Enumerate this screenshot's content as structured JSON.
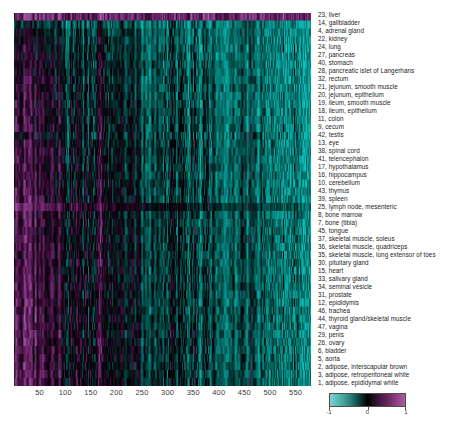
{
  "chart_data": {
    "type": "heatmap",
    "title": "",
    "xlabel": "",
    "ylabel": "",
    "xlim": [
      0,
      580
    ],
    "ylim": [
      0,
      47
    ],
    "grid": false,
    "x_ticks": [
      50,
      100,
      150,
      200,
      250,
      300,
      350,
      400,
      450,
      500,
      550
    ],
    "colorbar": {
      "ticks": [
        -1,
        0,
        1
      ],
      "tick_labels": [
        "-1",
        "0",
        "1"
      ],
      "vmin": -1,
      "vmax": 1,
      "low_color": "#7fd3c8",
      "mid_color": "#000000",
      "high_color": "#a85fa0",
      "position": "bottom-right"
    },
    "row_labels": [
      "23, liver",
      "14, gallbladder",
      "4, adrenal gland",
      "22, kidney",
      "24, lung",
      "27, pancreas",
      "40, stomach",
      "28, pancreatic islet of Langerhans",
      "32, rectum",
      "21, jejunum, smooth muscle",
      "20, jejunum, epithelium",
      "19, ileum, smooth muscle",
      "18, ileum, epithelium",
      "11, colon",
      "9, cecum",
      "42, testis",
      "13, eye",
      "38, spinal cord",
      "41, telencephalon",
      "17, hypothalamus",
      "16, hippocampus",
      "10, cerebellum",
      "43, thymus",
      "39, spleen",
      "25, lymph node, mesenteric",
      "8, bone marrow",
      "7, bone (tibia)",
      "45, tongue",
      "37, skeletal muscle, soleus",
      "36, skeletal muscle, quadriceps",
      "35, skeletal muscle, long extensor of toes",
      "30, pituitary gland",
      "15, heart",
      "33, salivary gland",
      "34, seminal vesicle",
      "31, prostate",
      "12, epididymis",
      "46, trachea",
      "44, thyroid gland/skeletal muscle",
      "47, vagina",
      "29, penis",
      "26, ovary",
      "6, bladder",
      "5, aorta",
      "2, adipose, interscapular brown",
      "3, adipose, retroperitoneal white",
      "1, adipose, epididymal white"
    ],
    "n_rows": 47,
    "n_columns": 580,
    "row_profiles": [
      {
        "row": 0,
        "base": 0.62,
        "grad": -0.05,
        "noise": 0.22,
        "streak": 0.55
      },
      {
        "row": 1,
        "base": -0.18,
        "grad": -0.55,
        "noise": 0.3,
        "streak": 0.7
      },
      {
        "row": 2,
        "base": 0.02,
        "grad": -0.75,
        "noise": 0.28,
        "streak": 0.65
      },
      {
        "row": 3,
        "base": 0.1,
        "grad": -0.85,
        "noise": 0.3,
        "streak": 0.68
      },
      {
        "row": 4,
        "base": 0.16,
        "grad": -0.92,
        "noise": 0.3,
        "streak": 0.66
      },
      {
        "row": 5,
        "base": 0.18,
        "grad": -0.95,
        "noise": 0.3,
        "streak": 0.64
      },
      {
        "row": 6,
        "base": 0.22,
        "grad": -0.98,
        "noise": 0.3,
        "streak": 0.66
      },
      {
        "row": 7,
        "base": 0.24,
        "grad": -1.0,
        "noise": 0.3,
        "streak": 0.66
      },
      {
        "row": 8,
        "base": 0.26,
        "grad": -1.02,
        "noise": 0.3,
        "streak": 0.66
      },
      {
        "row": 9,
        "base": 0.3,
        "grad": -1.05,
        "noise": 0.3,
        "streak": 0.68
      },
      {
        "row": 10,
        "base": 0.3,
        "grad": -1.05,
        "noise": 0.3,
        "streak": 0.68
      },
      {
        "row": 11,
        "base": 0.32,
        "grad": -1.06,
        "noise": 0.3,
        "streak": 0.68
      },
      {
        "row": 12,
        "base": 0.32,
        "grad": -1.06,
        "noise": 0.3,
        "streak": 0.68
      },
      {
        "row": 13,
        "base": 0.34,
        "grad": -1.08,
        "noise": 0.3,
        "streak": 0.68
      },
      {
        "row": 14,
        "base": 0.34,
        "grad": -1.08,
        "noise": 0.3,
        "streak": 0.68
      },
      {
        "row": 15,
        "base": 0.2,
        "grad": -0.9,
        "noise": 0.34,
        "streak": 0.72
      },
      {
        "row": 16,
        "base": 0.34,
        "grad": -1.06,
        "noise": 0.3,
        "streak": 0.66
      },
      {
        "row": 17,
        "base": 0.36,
        "grad": -1.08,
        "noise": 0.3,
        "streak": 0.66
      },
      {
        "row": 18,
        "base": 0.36,
        "grad": -1.08,
        "noise": 0.3,
        "streak": 0.66
      },
      {
        "row": 19,
        "base": 0.36,
        "grad": -1.08,
        "noise": 0.3,
        "streak": 0.66
      },
      {
        "row": 20,
        "base": 0.36,
        "grad": -1.08,
        "noise": 0.3,
        "streak": 0.66
      },
      {
        "row": 21,
        "base": 0.38,
        "grad": -1.1,
        "noise": 0.3,
        "streak": 0.66
      },
      {
        "row": 22,
        "base": 0.4,
        "grad": -1.1,
        "noise": 0.3,
        "streak": 0.66
      },
      {
        "row": 23,
        "base": 0.4,
        "grad": -1.1,
        "noise": 0.3,
        "streak": 0.66
      },
      {
        "row": 24,
        "base": 0.7,
        "grad": -1.2,
        "noise": 0.2,
        "streak": 0.4
      },
      {
        "row": 25,
        "base": 0.42,
        "grad": -1.1,
        "noise": 0.3,
        "streak": 0.66
      },
      {
        "row": 26,
        "base": 0.42,
        "grad": -1.1,
        "noise": 0.3,
        "streak": 0.66
      },
      {
        "row": 27,
        "base": 0.42,
        "grad": -1.1,
        "noise": 0.3,
        "streak": 0.66
      },
      {
        "row": 28,
        "base": 0.44,
        "grad": -1.12,
        "noise": 0.3,
        "streak": 0.66
      },
      {
        "row": 29,
        "base": 0.44,
        "grad": -1.12,
        "noise": 0.3,
        "streak": 0.66
      },
      {
        "row": 30,
        "base": 0.44,
        "grad": -1.12,
        "noise": 0.3,
        "streak": 0.66
      },
      {
        "row": 31,
        "base": 0.44,
        "grad": -1.12,
        "noise": 0.3,
        "streak": 0.66
      },
      {
        "row": 32,
        "base": 0.44,
        "grad": -1.12,
        "noise": 0.3,
        "streak": 0.66
      },
      {
        "row": 33,
        "base": 0.46,
        "grad": -1.14,
        "noise": 0.3,
        "streak": 0.66
      },
      {
        "row": 34,
        "base": 0.46,
        "grad": -1.14,
        "noise": 0.3,
        "streak": 0.66
      },
      {
        "row": 35,
        "base": 0.46,
        "grad": -1.14,
        "noise": 0.3,
        "streak": 0.66
      },
      {
        "row": 36,
        "base": 0.46,
        "grad": -1.14,
        "noise": 0.3,
        "streak": 0.66
      },
      {
        "row": 37,
        "base": 0.48,
        "grad": -1.16,
        "noise": 0.3,
        "streak": 0.66
      },
      {
        "row": 38,
        "base": 0.48,
        "grad": -1.16,
        "noise": 0.3,
        "streak": 0.66
      },
      {
        "row": 39,
        "base": 0.48,
        "grad": -1.16,
        "noise": 0.3,
        "streak": 0.66
      },
      {
        "row": 40,
        "base": 0.48,
        "grad": -1.16,
        "noise": 0.3,
        "streak": 0.66
      },
      {
        "row": 41,
        "base": 0.5,
        "grad": -1.18,
        "noise": 0.3,
        "streak": 0.66
      },
      {
        "row": 42,
        "base": 0.5,
        "grad": -1.18,
        "noise": 0.3,
        "streak": 0.66
      },
      {
        "row": 43,
        "base": 0.5,
        "grad": -1.18,
        "noise": 0.3,
        "streak": 0.66
      },
      {
        "row": 44,
        "base": 0.52,
        "grad": -1.2,
        "noise": 0.3,
        "streak": 0.66
      },
      {
        "row": 45,
        "base": 0.52,
        "grad": -1.2,
        "noise": 0.3,
        "streak": 0.66
      },
      {
        "row": 46,
        "base": 0.54,
        "grad": -1.22,
        "noise": 0.28,
        "streak": 0.62
      }
    ]
  }
}
